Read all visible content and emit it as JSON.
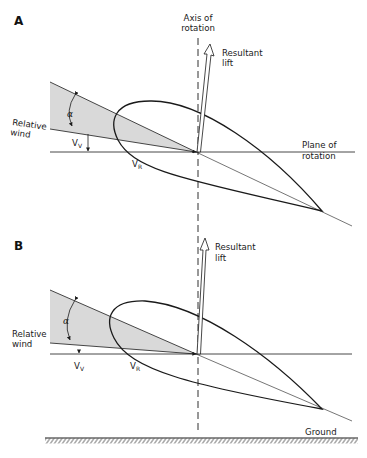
{
  "figure": {
    "type": "diagram",
    "colors": {
      "line": "#1a1a1a",
      "wedge_fill": "#d9d9d9",
      "background": "#ffffff"
    }
  },
  "panel_a": {
    "label": "A",
    "axis_label_line1": "Axis of",
    "axis_label_line2": "rotation",
    "lift_label_line1": "Resultant",
    "lift_label_line2": "lift",
    "wind_label_line1": "Relative",
    "wind_label_line2": "wind",
    "alpha": "α",
    "vv_main": "V",
    "vv_sub": "V",
    "vr_main": "V",
    "vr_sub": "R",
    "plane_label_line1": "Plane of",
    "plane_label_line2": "rotation"
  },
  "panel_b": {
    "label": "B",
    "lift_label_line1": "Resultant",
    "lift_label_line2": "lift",
    "wind_label_line1": "Relative",
    "wind_label_line2": "wind",
    "alpha": "α",
    "vv_main": "V",
    "vv_sub": "V",
    "vr_main": "V",
    "vr_sub": "R",
    "ground_label": "Ground"
  }
}
